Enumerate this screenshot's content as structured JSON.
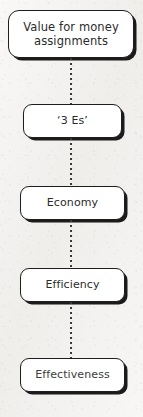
{
  "diagram": {
    "type": "vertical-flowchart",
    "background_color": "#f2f0ee",
    "node_fill_color": "#ffffff",
    "node_border_color": "#1d1d1d",
    "connector_color": "#3a3a3a",
    "connector_style": "dotted",
    "nodes": [
      {
        "id": "root",
        "label": "Value for money\nassignments",
        "line1": "Value for money",
        "line2": "assignments"
      },
      {
        "id": "3es",
        "label": "‘3 Es’"
      },
      {
        "id": "economy",
        "label": "Economy"
      },
      {
        "id": "efficiency",
        "label": "Efficiency"
      },
      {
        "id": "effectiveness",
        "label": "Effectiveness"
      }
    ],
    "connectors": [
      {
        "id": "connector-1",
        "from": "root",
        "to": "3es"
      },
      {
        "id": "connector-2",
        "from": "3es",
        "to": "economy"
      },
      {
        "id": "connector-3",
        "from": "economy",
        "to": "efficiency"
      },
      {
        "id": "connector-4",
        "from": "efficiency",
        "to": "effectiveness"
      }
    ]
  }
}
